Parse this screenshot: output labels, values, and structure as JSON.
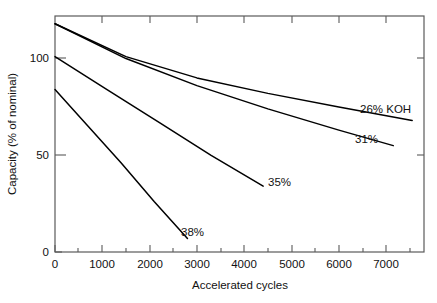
{
  "chart_data": {
    "type": "line",
    "title": "",
    "xlabel": "Accelerated cycles",
    "ylabel": "Capacity (% of nominal)",
    "xlim": [
      0,
      7800
    ],
    "ylim": [
      0,
      122
    ],
    "xticks": [
      0,
      1000,
      2000,
      3000,
      4000,
      5000,
      6000,
      7000
    ],
    "xtick_labels": [
      "0",
      "1000",
      "2000",
      "3000",
      "4000",
      "5000",
      "6000",
      "7000"
    ],
    "yticks": [
      0,
      50,
      100
    ],
    "ytick_labels": [
      "0",
      "50",
      "100"
    ],
    "grid": false,
    "legend": "inline-end-labels",
    "series": [
      {
        "name": "26% KOH",
        "label": "26% KOH",
        "x": [
          0,
          1500,
          3000,
          4500,
          6000,
          7550
        ],
        "values": [
          118,
          101,
          90,
          82,
          75,
          68
        ]
      },
      {
        "name": "31%",
        "label": "31%",
        "x": [
          0,
          1500,
          3000,
          4500,
          6000,
          7150
        ],
        "values": [
          118,
          100,
          86,
          74,
          63,
          55
        ]
      },
      {
        "name": "35%",
        "label": "35%",
        "x": [
          0,
          1100,
          2200,
          3300,
          4400
        ],
        "values": [
          101,
          84,
          67,
          50,
          34
        ]
      },
      {
        "name": "38%",
        "label": "38%",
        "x": [
          0,
          700,
          1400,
          2100,
          2800
        ],
        "values": [
          84,
          65,
          46,
          26,
          7
        ]
      }
    ],
    "colors": {
      "line": "#000000",
      "axis": "#5a5a5a",
      "background": "#ffffff",
      "text": "#111111"
    }
  }
}
